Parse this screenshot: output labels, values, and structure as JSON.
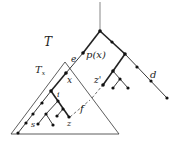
{
  "diagram": {
    "labels": {
      "T": "T",
      "Tx_main": "T",
      "Tx_sub": "x",
      "px": "p(x)",
      "e": "e",
      "x": "x",
      "zprime": "z'",
      "d": "d",
      "i": "i",
      "f": "f",
      "s": "s",
      "z": "z"
    },
    "colors": {
      "edge": "#222222",
      "node": "#111111",
      "triangle": "#333333"
    }
  }
}
